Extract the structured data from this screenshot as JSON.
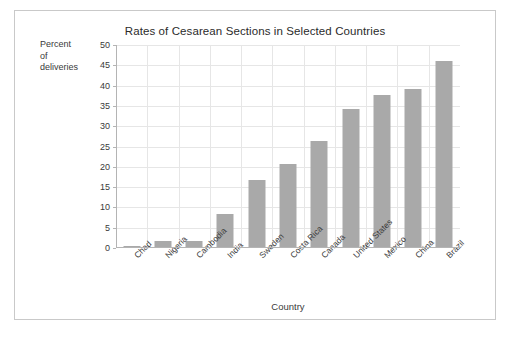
{
  "chart_data": {
    "type": "bar",
    "title": "Rates of Cesarean Sections in Selected Countries",
    "xlabel": "Country",
    "ylabel": "Percent of deliveries",
    "ylabel_lines": [
      "Percent",
      "of",
      "deliveries"
    ],
    "categories": [
      "Chad",
      "Nigeria",
      "Cambodia",
      "India",
      "Sweden",
      "Costa Rica",
      "Canada",
      "United States",
      "Mexico",
      "China",
      "Brazil"
    ],
    "values": [
      0.4,
      1.8,
      1.8,
      8.5,
      16.8,
      20.6,
      26.3,
      34.3,
      37.8,
      39.1,
      46.0
    ],
    "ylim": [
      0,
      50
    ],
    "yticks": [
      0,
      5,
      10,
      15,
      20,
      25,
      30,
      35,
      40,
      45,
      50
    ],
    "ytick_labels": [
      "0",
      "5",
      "10",
      "15",
      "20",
      "25",
      "30",
      "35",
      "40",
      "45",
      "50"
    ],
    "grid": true,
    "legend": "none",
    "series_color": "#a9a9a9"
  }
}
